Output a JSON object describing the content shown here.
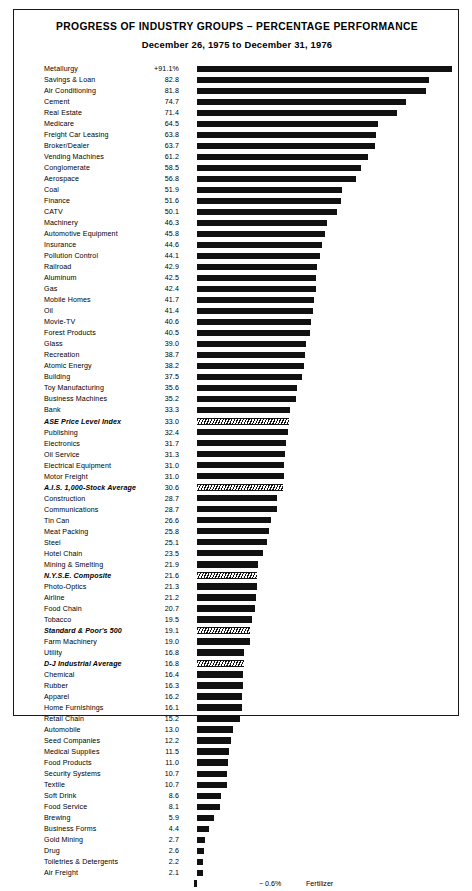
{
  "header": {
    "title": "PROGRESS OF INDUSTRY GROUPS – PERCENTAGE PERFORMANCE",
    "subtitle": "December 26, 1975 to December 31, 1976"
  },
  "footer": {
    "negative_value": "− 0.6%",
    "negative_label": "Fertilizer"
  },
  "chart_data": {
    "type": "bar",
    "orientation": "horizontal",
    "title": "PROGRESS OF INDUSTRY GROUPS – PERCENTAGE PERFORMANCE",
    "subtitle": "December 26, 1975 to December 31, 1976",
    "xlabel": "",
    "ylabel": "",
    "xlim": [
      -0.6,
      91.1
    ],
    "grid": false,
    "legend": null,
    "value_suffix": "%",
    "note": "Italic bold entries with cross-hatched bars are market indexes / averages rather than industry groups.",
    "categories": [
      "Metallurgy",
      "Savings & Loan",
      "Air Conditioning",
      "Cement",
      "Real Estate",
      "Medicare",
      "Freight Car Leasing",
      "Broker/Dealer",
      "Vending Machines",
      "Conglomerate",
      "Aerospace",
      "Coal",
      "Finance",
      "CATV",
      "Machinery",
      "Automotive Equipment",
      "Insurance",
      "Pollution Control",
      "Railroad",
      "Aluminum",
      "Gas",
      "Mobile Homes",
      "Oil",
      "Movie-TV",
      "Forest Products",
      "Glass",
      "Recreation",
      "Atomic Energy",
      "Building",
      "Toy Manufacturing",
      "Business Machines",
      "Bank",
      "ASE Price Level Index",
      "Publishing",
      "Electronics",
      "Oil Service",
      "Electrical Equipment",
      "Motor Freight",
      "A.I.S. 1,000-Stock Average",
      "Construction",
      "Communications",
      "Tin Can",
      "Meat Packing",
      "Steel",
      "Hotel Chain",
      "Mining & Smelting",
      "N.Y.S.E. Composite",
      "Photo-Optics",
      "Airline",
      "Food Chain",
      "Tobacco",
      "Standard & Poor's 500",
      "Farm Machinery",
      "Utility",
      "D-J Industrial Average",
      "Chemical",
      "Rubber",
      "Apparel",
      "Home Furnishings",
      "Retail Chain",
      "Automobile",
      "Seed Companies",
      "Medical Supplies",
      "Food Products",
      "Security Systems",
      "Textile",
      "Soft Drink",
      "Food Service",
      "Brewing",
      "Business Forms",
      "Gold Mining",
      "Drug",
      "Toiletries & Detergents",
      "Air Freight",
      "Fertilizer"
    ],
    "values": [
      91.1,
      82.8,
      81.8,
      74.7,
      71.4,
      64.5,
      63.8,
      63.7,
      61.2,
      58.5,
      56.8,
      51.9,
      51.6,
      50.1,
      46.3,
      45.8,
      44.6,
      44.1,
      42.9,
      42.5,
      42.4,
      41.7,
      41.4,
      40.6,
      40.5,
      39.0,
      38.7,
      38.2,
      37.5,
      35.6,
      35.2,
      33.3,
      33.0,
      32.4,
      31.7,
      31.3,
      31.0,
      31.0,
      30.6,
      28.7,
      28.7,
      26.6,
      25.8,
      25.1,
      23.5,
      21.9,
      21.6,
      21.3,
      21.2,
      20.7,
      19.5,
      19.1,
      19.0,
      16.8,
      16.8,
      16.4,
      16.3,
      16.2,
      16.1,
      15.2,
      13.0,
      12.2,
      11.5,
      11.0,
      10.7,
      10.7,
      8.6,
      8.1,
      5.9,
      4.4,
      2.7,
      2.6,
      2.2,
      2.1,
      -0.6
    ],
    "value_labels": [
      "+91.1%",
      "82.8",
      "81.8",
      "74.7",
      "71.4",
      "64.5",
      "63.8",
      "63.7",
      "61.2",
      "58.5",
      "56.8",
      "51.9",
      "51.6",
      "50.1",
      "46.3",
      "45.8",
      "44.6",
      "44.1",
      "42.9",
      "42.5",
      "42.4",
      "41.7",
      "41.4",
      "40.6",
      "40.5",
      "39.0",
      "38.7",
      "38.2",
      "37.5",
      "35.6",
      "35.2",
      "33.3",
      "33.0",
      "32.4",
      "31.7",
      "31.3",
      "31.0",
      "31.0",
      "30.6",
      "28.7",
      "28.7",
      "26.6",
      "25.8",
      "25.1",
      "23.5",
      "21.9",
      "21.6",
      "21.3",
      "21.2",
      "20.7",
      "19.5",
      "19.1",
      "19.0",
      "16.8",
      "16.8",
      "16.4",
      "16.3",
      "16.2",
      "16.1",
      "15.2",
      "13.0",
      "12.2",
      "11.5",
      "11.0",
      "10.7",
      "10.7",
      "8.6",
      "8.1",
      "5.9",
      "4.4",
      "2.7",
      "2.6",
      "2.2",
      "2.1",
      "− 0.6%"
    ],
    "index_rows": [
      "ASE Price Level Index",
      "A.I.S. 1,000-Stock Average",
      "N.Y.S.E. Composite",
      "Standard & Poor's 500",
      "D-J Industrial Average"
    ],
    "colors": {
      "bar": "#111111",
      "index_bar_hatch": "#111111",
      "background": "#ffffff",
      "text": "#000000"
    }
  }
}
